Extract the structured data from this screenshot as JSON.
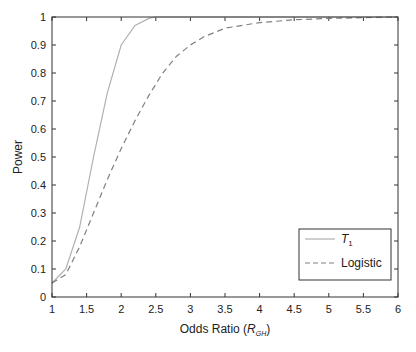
{
  "chart_data": {
    "type": "line",
    "title": "",
    "xlabel": "Odds Ratio (R_GH)",
    "xlabel_main": "Odds Ratio (",
    "xlabel_var": "R",
    "xlabel_sub": "GH",
    "xlabel_close": ")",
    "ylabel": "Power",
    "xlim": [
      1,
      6
    ],
    "ylim": [
      0,
      1
    ],
    "xticks": [
      "1",
      "1.5",
      "2",
      "2.5",
      "3",
      "3.5",
      "4",
      "4.5",
      "5",
      "5.5",
      "6"
    ],
    "yticks": [
      "0",
      "0.1",
      "0.2",
      "0.3",
      "0.4",
      "0.5",
      "0.6",
      "0.7",
      "0.8",
      "0.9",
      "1"
    ],
    "grid": false,
    "legend_position": "lower right",
    "series": [
      {
        "name": "T1",
        "legend_label": "T",
        "legend_sub": "1",
        "style": "solid",
        "color": "#b0b0b0",
        "x": [
          1,
          1.2,
          1.4,
          1.6,
          1.8,
          2.0,
          2.2,
          2.4,
          2.5,
          3,
          4,
          5,
          6
        ],
        "y": [
          0.05,
          0.1,
          0.25,
          0.5,
          0.73,
          0.9,
          0.97,
          0.995,
          1.0,
          1.0,
          1.0,
          1.0,
          1.0
        ]
      },
      {
        "name": "Logistic",
        "legend_label": "Logistic",
        "style": "dashed",
        "color": "#808080",
        "x": [
          1,
          1.2,
          1.4,
          1.6,
          1.8,
          2.0,
          2.2,
          2.4,
          2.6,
          2.8,
          3.0,
          3.2,
          3.5,
          4.0,
          4.5,
          5.0,
          6.0
        ],
        "y": [
          0.05,
          0.08,
          0.18,
          0.3,
          0.42,
          0.53,
          0.63,
          0.72,
          0.8,
          0.86,
          0.9,
          0.93,
          0.96,
          0.98,
          0.99,
          0.995,
          1.0
        ]
      }
    ]
  }
}
